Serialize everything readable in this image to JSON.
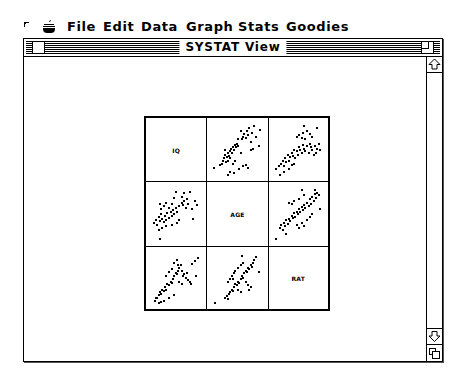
{
  "menubar": {
    "apple_icon": "apple-menu-icon",
    "items": [
      {
        "label": "File",
        "x": 67
      },
      {
        "label": "Edit",
        "x": 103
      },
      {
        "label": "Data",
        "x": 141
      },
      {
        "label": "Graph",
        "x": 186
      },
      {
        "label": "Stats",
        "x": 238
      },
      {
        "label": "Goodies",
        "x": 286
      }
    ]
  },
  "window": {
    "title": "SYSTAT View"
  },
  "chart_data": {
    "type": "scatter",
    "variables": [
      "IQ",
      "AGE",
      "RAT"
    ],
    "grid": false,
    "layout": "3x3 SPLOM, diagonal shows variable names",
    "panels": [
      {
        "row": 0,
        "col": 1,
        "x_var": "AGE",
        "y_var": "IQ",
        "correlation": "positive, moderate",
        "points": [
          [
            0.03,
            0.18
          ],
          [
            0.15,
            0.22
          ],
          [
            0.18,
            0.25
          ],
          [
            0.2,
            0.3
          ],
          [
            0.22,
            0.35
          ],
          [
            0.25,
            0.42
          ],
          [
            0.28,
            0.38
          ],
          [
            0.3,
            0.45
          ],
          [
            0.32,
            0.4
          ],
          [
            0.34,
            0.48
          ],
          [
            0.36,
            0.52
          ],
          [
            0.38,
            0.44
          ],
          [
            0.4,
            0.55
          ],
          [
            0.42,
            0.5
          ],
          [
            0.44,
            0.6
          ],
          [
            0.46,
            0.56
          ],
          [
            0.48,
            0.62
          ],
          [
            0.5,
            0.58
          ],
          [
            0.3,
            0.3
          ],
          [
            0.34,
            0.35
          ],
          [
            0.26,
            0.28
          ],
          [
            0.24,
            0.5
          ],
          [
            0.4,
            0.25
          ],
          [
            0.45,
            0.3
          ],
          [
            0.55,
            0.45
          ],
          [
            0.58,
            0.7
          ],
          [
            0.6,
            0.75
          ],
          [
            0.62,
            0.8
          ],
          [
            0.65,
            0.72
          ],
          [
            0.68,
            0.85
          ],
          [
            0.7,
            0.78
          ],
          [
            0.72,
            0.9
          ],
          [
            0.75,
            0.65
          ],
          [
            0.78,
            0.82
          ],
          [
            0.82,
            0.95
          ],
          [
            0.85,
            0.75
          ],
          [
            0.5,
            0.7
          ],
          [
            0.55,
            0.85
          ],
          [
            0.52,
            0.15
          ],
          [
            0.6,
            0.2
          ],
          [
            0.65,
            0.22
          ],
          [
            0.7,
            0.18
          ],
          [
            0.75,
            0.5
          ],
          [
            0.8,
            0.52
          ],
          [
            0.9,
            0.58
          ],
          [
            0.92,
            0.88
          ],
          [
            0.35,
            0.1
          ],
          [
            0.3,
            0.05
          ],
          [
            0.42,
            0.08
          ]
        ]
      },
      {
        "row": 0,
        "col": 2,
        "x_var": "RAT",
        "y_var": "IQ",
        "correlation": "positive, moderate",
        "points": [
          [
            0.05,
            0.15
          ],
          [
            0.1,
            0.2
          ],
          [
            0.15,
            0.25
          ],
          [
            0.18,
            0.3
          ],
          [
            0.2,
            0.2
          ],
          [
            0.22,
            0.35
          ],
          [
            0.25,
            0.28
          ],
          [
            0.28,
            0.42
          ],
          [
            0.3,
            0.3
          ],
          [
            0.32,
            0.38
          ],
          [
            0.35,
            0.45
          ],
          [
            0.38,
            0.4
          ],
          [
            0.4,
            0.5
          ],
          [
            0.42,
            0.35
          ],
          [
            0.45,
            0.48
          ],
          [
            0.48,
            0.42
          ],
          [
            0.5,
            0.55
          ],
          [
            0.52,
            0.5
          ],
          [
            0.55,
            0.45
          ],
          [
            0.58,
            0.6
          ],
          [
            0.6,
            0.52
          ],
          [
            0.62,
            0.48
          ],
          [
            0.65,
            0.58
          ],
          [
            0.68,
            0.45
          ],
          [
            0.7,
            0.62
          ],
          [
            0.72,
            0.55
          ],
          [
            0.75,
            0.5
          ],
          [
            0.78,
            0.42
          ],
          [
            0.8,
            0.58
          ],
          [
            0.85,
            0.52
          ],
          [
            0.9,
            0.5
          ],
          [
            0.45,
            0.75
          ],
          [
            0.5,
            0.78
          ],
          [
            0.55,
            0.72
          ],
          [
            0.58,
            0.82
          ],
          [
            0.62,
            0.7
          ],
          [
            0.65,
            0.85
          ],
          [
            0.7,
            0.8
          ],
          [
            0.75,
            0.75
          ],
          [
            0.6,
            0.95
          ],
          [
            0.85,
            0.9
          ],
          [
            0.2,
            0.1
          ],
          [
            0.12,
            0.05
          ],
          [
            0.3,
            0.15
          ],
          [
            0.35,
            0.22
          ],
          [
            0.4,
            0.25
          ],
          [
            0.82,
            0.45
          ],
          [
            0.88,
            0.62
          ]
        ]
      },
      {
        "row": 1,
        "col": 0,
        "x_var": "IQ",
        "y_var": "AGE",
        "correlation": "positive, moderate",
        "points": [
          [
            0.05,
            0.35
          ],
          [
            0.1,
            0.4
          ],
          [
            0.12,
            0.3
          ],
          [
            0.15,
            0.45
          ],
          [
            0.18,
            0.38
          ],
          [
            0.2,
            0.5
          ],
          [
            0.22,
            0.42
          ],
          [
            0.25,
            0.36
          ],
          [
            0.28,
            0.48
          ],
          [
            0.3,
            0.4
          ],
          [
            0.32,
            0.52
          ],
          [
            0.35,
            0.44
          ],
          [
            0.38,
            0.55
          ],
          [
            0.4,
            0.48
          ],
          [
            0.42,
            0.58
          ],
          [
            0.45,
            0.5
          ],
          [
            0.48,
            0.62
          ],
          [
            0.5,
            0.55
          ],
          [
            0.2,
            0.6
          ],
          [
            0.18,
            0.7
          ],
          [
            0.25,
            0.65
          ],
          [
            0.3,
            0.72
          ],
          [
            0.35,
            0.62
          ],
          [
            0.4,
            0.7
          ],
          [
            0.45,
            0.8
          ],
          [
            0.55,
            0.65
          ],
          [
            0.6,
            0.72
          ],
          [
            0.62,
            0.68
          ],
          [
            0.65,
            0.75
          ],
          [
            0.68,
            0.62
          ],
          [
            0.7,
            0.78
          ],
          [
            0.72,
            0.7
          ],
          [
            0.75,
            0.92
          ],
          [
            0.8,
            0.6
          ],
          [
            0.85,
            0.75
          ],
          [
            0.9,
            0.68
          ],
          [
            0.6,
            0.82
          ],
          [
            0.65,
            0.9
          ],
          [
            0.48,
            0.92
          ],
          [
            0.82,
            0.42
          ],
          [
            0.55,
            0.4
          ],
          [
            0.3,
            0.28
          ],
          [
            0.22,
            0.25
          ],
          [
            0.15,
            0.22
          ],
          [
            0.4,
            0.3
          ],
          [
            0.5,
            0.35
          ],
          [
            0.18,
            0.05
          ]
        ]
      },
      {
        "row": 1,
        "col": 2,
        "x_var": "RAT",
        "y_var": "AGE",
        "correlation": "positive, strong",
        "points": [
          [
            0.05,
            0.05
          ],
          [
            0.12,
            0.25
          ],
          [
            0.15,
            0.3
          ],
          [
            0.18,
            0.22
          ],
          [
            0.2,
            0.35
          ],
          [
            0.22,
            0.28
          ],
          [
            0.25,
            0.4
          ],
          [
            0.28,
            0.32
          ],
          [
            0.3,
            0.42
          ],
          [
            0.32,
            0.38
          ],
          [
            0.35,
            0.48
          ],
          [
            0.38,
            0.44
          ],
          [
            0.4,
            0.52
          ],
          [
            0.42,
            0.46
          ],
          [
            0.45,
            0.55
          ],
          [
            0.48,
            0.5
          ],
          [
            0.5,
            0.6
          ],
          [
            0.52,
            0.54
          ],
          [
            0.55,
            0.64
          ],
          [
            0.58,
            0.58
          ],
          [
            0.6,
            0.68
          ],
          [
            0.62,
            0.62
          ],
          [
            0.65,
            0.72
          ],
          [
            0.68,
            0.66
          ],
          [
            0.7,
            0.78
          ],
          [
            0.72,
            0.7
          ],
          [
            0.75,
            0.82
          ],
          [
            0.78,
            0.75
          ],
          [
            0.8,
            0.88
          ],
          [
            0.82,
            0.8
          ],
          [
            0.85,
            0.9
          ],
          [
            0.88,
            0.85
          ],
          [
            0.3,
            0.72
          ],
          [
            0.35,
            0.7
          ],
          [
            0.4,
            0.75
          ],
          [
            0.5,
            0.78
          ],
          [
            0.55,
            0.95
          ],
          [
            0.6,
            0.85
          ],
          [
            0.8,
            0.95
          ],
          [
            0.45,
            0.3
          ],
          [
            0.55,
            0.35
          ],
          [
            0.65,
            0.4
          ],
          [
            0.7,
            0.45
          ],
          [
            0.75,
            0.5
          ],
          [
            0.9,
            0.6
          ],
          [
            0.5,
            0.25
          ],
          [
            0.6,
            0.28
          ],
          [
            0.25,
            0.15
          ]
        ]
      },
      {
        "row": 2,
        "col": 0,
        "x_var": "IQ",
        "y_var": "RAT",
        "correlation": "positive, moderate",
        "points": [
          [
            0.08,
            0.1
          ],
          [
            0.12,
            0.15
          ],
          [
            0.15,
            0.2
          ],
          [
            0.18,
            0.25
          ],
          [
            0.2,
            0.22
          ],
          [
            0.22,
            0.3
          ],
          [
            0.25,
            0.28
          ],
          [
            0.28,
            0.35
          ],
          [
            0.3,
            0.3
          ],
          [
            0.32,
            0.4
          ],
          [
            0.35,
            0.38
          ],
          [
            0.38,
            0.45
          ],
          [
            0.4,
            0.42
          ],
          [
            0.42,
            0.5
          ],
          [
            0.45,
            0.55
          ],
          [
            0.48,
            0.6
          ],
          [
            0.5,
            0.58
          ],
          [
            0.52,
            0.65
          ],
          [
            0.55,
            0.7
          ],
          [
            0.58,
            0.75
          ],
          [
            0.3,
            0.55
          ],
          [
            0.35,
            0.62
          ],
          [
            0.4,
            0.68
          ],
          [
            0.45,
            0.8
          ],
          [
            0.5,
            0.85
          ],
          [
            0.52,
            0.75
          ],
          [
            0.6,
            0.65
          ],
          [
            0.62,
            0.55
          ],
          [
            0.65,
            0.58
          ],
          [
            0.68,
            0.52
          ],
          [
            0.7,
            0.6
          ],
          [
            0.72,
            0.48
          ],
          [
            0.75,
            0.45
          ],
          [
            0.78,
            0.4
          ],
          [
            0.8,
            0.78
          ],
          [
            0.85,
            0.82
          ],
          [
            0.88,
            0.55
          ],
          [
            0.92,
            0.88
          ],
          [
            0.55,
            0.45
          ],
          [
            0.6,
            0.4
          ],
          [
            0.45,
            0.2
          ],
          [
            0.25,
            0.1
          ],
          [
            0.2,
            0.08
          ],
          [
            0.15,
            0.05
          ],
          [
            0.1,
            0.15
          ],
          [
            0.35,
            0.15
          ]
        ]
      },
      {
        "row": 2,
        "col": 1,
        "x_var": "AGE",
        "y_var": "RAT",
        "correlation": "positive, strong",
        "points": [
          [
            0.05,
            0.05
          ],
          [
            0.25,
            0.15
          ],
          [
            0.28,
            0.18
          ],
          [
            0.3,
            0.12
          ],
          [
            0.32,
            0.22
          ],
          [
            0.35,
            0.25
          ],
          [
            0.38,
            0.3
          ],
          [
            0.4,
            0.28
          ],
          [
            0.42,
            0.35
          ],
          [
            0.45,
            0.4
          ],
          [
            0.48,
            0.38
          ],
          [
            0.5,
            0.45
          ],
          [
            0.52,
            0.42
          ],
          [
            0.55,
            0.5
          ],
          [
            0.58,
            0.55
          ],
          [
            0.6,
            0.52
          ],
          [
            0.62,
            0.6
          ],
          [
            0.65,
            0.65
          ],
          [
            0.68,
            0.62
          ],
          [
            0.7,
            0.7
          ],
          [
            0.72,
            0.68
          ],
          [
            0.75,
            0.75
          ],
          [
            0.78,
            0.72
          ],
          [
            0.8,
            0.8
          ],
          [
            0.82,
            0.85
          ],
          [
            0.85,
            0.9
          ],
          [
            0.4,
            0.5
          ],
          [
            0.38,
            0.55
          ],
          [
            0.42,
            0.6
          ],
          [
            0.45,
            0.65
          ],
          [
            0.5,
            0.7
          ],
          [
            0.55,
            0.75
          ],
          [
            0.6,
            0.8
          ],
          [
            0.58,
            0.92
          ],
          [
            0.65,
            0.45
          ],
          [
            0.7,
            0.38
          ],
          [
            0.72,
            0.3
          ],
          [
            0.75,
            0.35
          ],
          [
            0.3,
            0.45
          ],
          [
            0.35,
            0.5
          ],
          [
            0.9,
            0.62
          ],
          [
            0.5,
            0.3
          ],
          [
            0.55,
            0.25
          ]
        ]
      }
    ]
  }
}
